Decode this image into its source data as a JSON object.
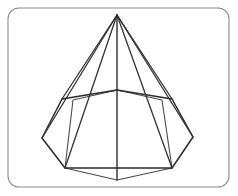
{
  "figure": {
    "kind": "line-drawing",
    "background_color": "#ffffff",
    "frame": {
      "name": "rounded-rectangle-border",
      "x": 8,
      "y": 8,
      "width": 221,
      "height": 179,
      "corner_radius": 11,
      "stroke_color": "#8a8a8a",
      "fill_color": "#ffffff",
      "stroke_width": 1.1
    },
    "colors": {
      "visible_edge": "#2b2b2b",
      "hidden_edge": "#4a4a4a",
      "lateral_edge": "#333333",
      "axis_edge": "#2f2f2f",
      "frame": "#8a8a8a",
      "paper": "#ffffff"
    },
    "points": {
      "apex": {
        "label": "apex",
        "x": 117,
        "y": 15
      },
      "base_back": {
        "label": "back vertex",
        "x": 117,
        "y": 90
      },
      "base_back_left": {
        "label": "back-left vertex",
        "x": 62,
        "y": 99
      },
      "base_back_right": {
        "label": "back-right vertex",
        "x": 172,
        "y": 99
      },
      "base_left": {
        "label": "left vertex",
        "x": 42,
        "y": 138
      },
      "base_right": {
        "label": "right vertex",
        "x": 193,
        "y": 137
      },
      "base_front_left": {
        "label": "front-left vertex",
        "x": 65,
        "y": 168
      },
      "base_front_right": {
        "label": "front-right vertex",
        "x": 172,
        "y": 168
      },
      "base_front": {
        "label": "front vertex",
        "x": 117,
        "y": 180
      },
      "inner_left": {
        "label": "inner-left vertex",
        "x": 73,
        "y": 100
      },
      "inner_right": {
        "label": "inner-right vertex",
        "x": 162,
        "y": 100
      }
    },
    "paths": {
      "outer_base_polygon": "M 117 90 L 172 99 L 193 137 L 172 168 L 65 168 L 42 138 L 62 99 Z",
      "inner_base_polygon": "M 117 90 L 162 100 L 172 168 L 117 180 L 65 168 L 73 100 Z",
      "lateral_apex_to_back_left": "M 117 15 L 62 99",
      "lateral_apex_to_back_right": "M 117 15 L 172 99",
      "lateral_apex_to_left": "M 117 15 L 42 138",
      "lateral_apex_to_right": "M 117 15 L 193 137",
      "lateral_apex_to_front_left": "M 117 15 L 65 168",
      "lateral_apex_to_front_right": "M 117 15 L 172 168",
      "axis_apex_to_back": "M 117 15 L 117 90",
      "axis_back_to_front": "M 117 90 L 117 180"
    }
  }
}
